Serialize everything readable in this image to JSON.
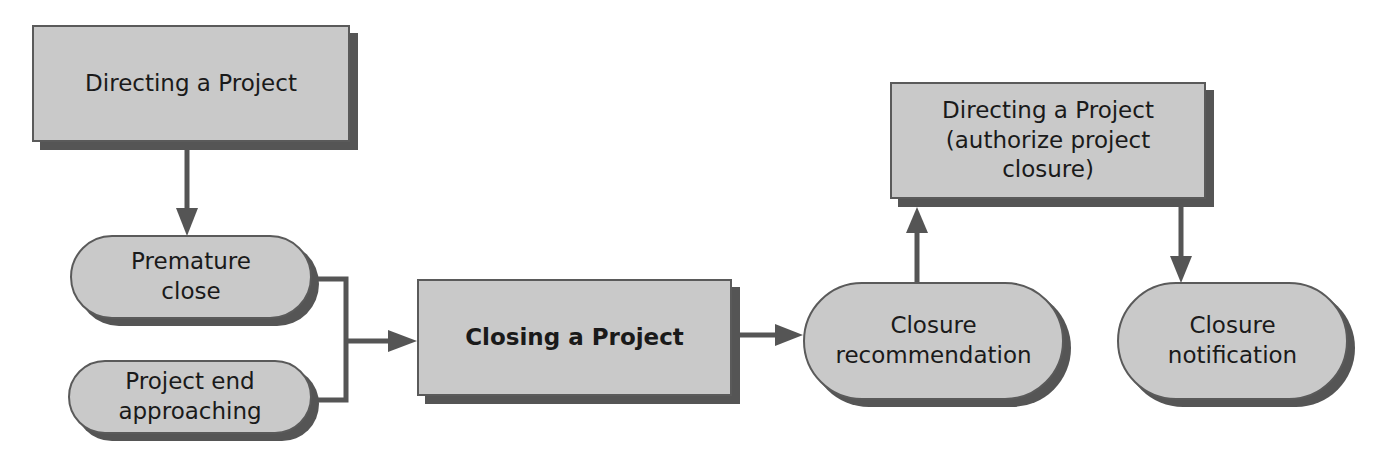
{
  "diagram": {
    "nodes": [
      {
        "id": "directing-project",
        "shape": "rectangle",
        "label": "Directing a Project"
      },
      {
        "id": "premature-close",
        "shape": "pill",
        "label": "Premature\nclose"
      },
      {
        "id": "project-end-approaching",
        "shape": "pill",
        "label": "Project end\napproaching"
      },
      {
        "id": "closing-project",
        "shape": "rectangle",
        "label": "Closing a Project",
        "bold": true
      },
      {
        "id": "closure-recommendation",
        "shape": "pill",
        "label": "Closure\nrecommendation"
      },
      {
        "id": "directing-authorize",
        "shape": "rectangle",
        "label": "Directing a Project\n(authorize project\nclosure)"
      },
      {
        "id": "closure-notification",
        "shape": "pill",
        "label": "Closure\nnotification"
      }
    ],
    "edges": [
      {
        "from": "directing-project",
        "to": "premature-close"
      },
      {
        "from": "premature-close",
        "to": "closing-project"
      },
      {
        "from": "project-end-approaching",
        "to": "closing-project"
      },
      {
        "from": "closing-project",
        "to": "closure-recommendation"
      },
      {
        "from": "closure-recommendation",
        "to": "directing-authorize"
      },
      {
        "from": "directing-authorize",
        "to": "closure-notification"
      }
    ],
    "colors": {
      "fill": "#c9c9c9",
      "border": "#5a5a5a",
      "shadow": "#555555",
      "edge": "#555555"
    }
  }
}
